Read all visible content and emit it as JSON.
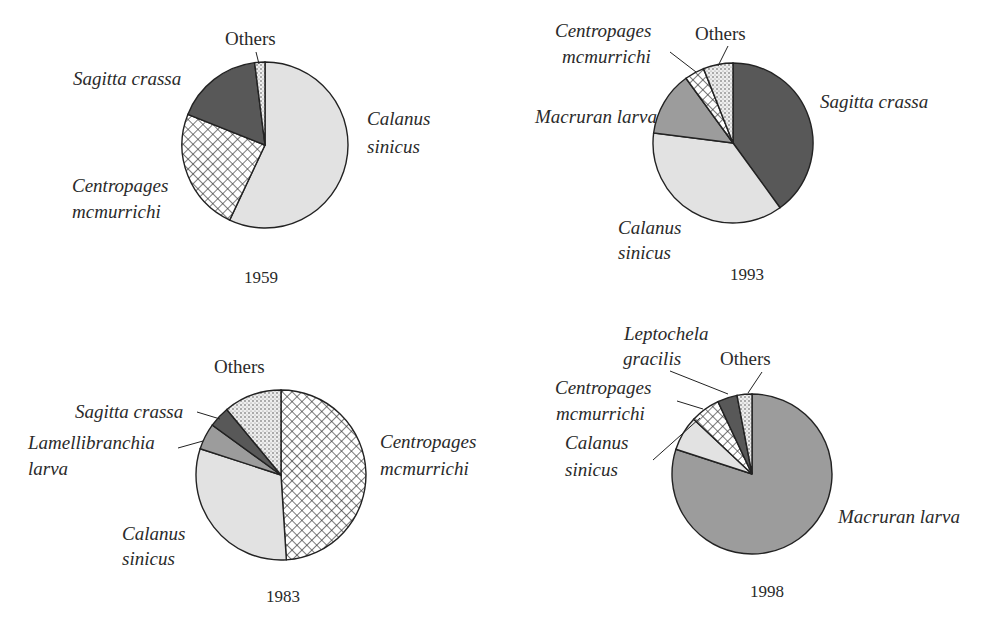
{
  "chart_data": [
    {
      "type": "pie",
      "title": "1959",
      "start_angle_deg": 0,
      "direction": "clockwise",
      "slices": [
        {
          "label": "Calanus sinicus",
          "value": 57,
          "fill": "light-gray"
        },
        {
          "label": "Centropages mcmurrichi",
          "value": 24,
          "fill": "crosshatch"
        },
        {
          "label": "Sagitta crassa",
          "value": 17,
          "fill": "dark-gray"
        },
        {
          "label": "Others",
          "value": 2,
          "fill": "dotted"
        }
      ]
    },
    {
      "type": "pie",
      "title": "1993",
      "start_angle_deg": 0,
      "direction": "clockwise",
      "slices": [
        {
          "label": "Sagitta crassa",
          "value": 40,
          "fill": "dark-gray"
        },
        {
          "label": "Calanus sinicus",
          "value": 37,
          "fill": "light-gray"
        },
        {
          "label": "Macruran larva",
          "value": 13,
          "fill": "medium-gray"
        },
        {
          "label": "Centropages mcmurrichi",
          "value": 4,
          "fill": "crosshatch"
        },
        {
          "label": "Others",
          "value": 6,
          "fill": "dotted"
        }
      ]
    },
    {
      "type": "pie",
      "title": "1983",
      "start_angle_deg": 0,
      "direction": "clockwise",
      "slices": [
        {
          "label": "Centropages mcmurrichi",
          "value": 49,
          "fill": "crosshatch"
        },
        {
          "label": "Calanus sinicus",
          "value": 31,
          "fill": "light-gray"
        },
        {
          "label": "Lamellibranchia larva",
          "value": 5,
          "fill": "medium-gray"
        },
        {
          "label": "Sagitta crassa",
          "value": 4,
          "fill": "dark-gray"
        },
        {
          "label": "Others",
          "value": 11,
          "fill": "dotted"
        }
      ]
    },
    {
      "type": "pie",
      "title": "1998",
      "start_angle_deg": 0,
      "direction": "clockwise",
      "slices": [
        {
          "label": "Macruran larva",
          "value": 80,
          "fill": "medium-gray"
        },
        {
          "label": "Calanus sinicus",
          "value": 7,
          "fill": "light-gray"
        },
        {
          "label": "Centropages mcmurrichi",
          "value": 6,
          "fill": "crosshatch"
        },
        {
          "label": "Leptochela gracilis",
          "value": 4,
          "fill": "dark-gray"
        },
        {
          "label": "Others",
          "value": 3,
          "fill": "dotted"
        }
      ]
    }
  ],
  "colors": {
    "light-gray": "#e2e2e2",
    "medium-gray": "#9c9c9c",
    "dark-gray": "#585858",
    "outline": "#222222"
  },
  "panels": {
    "p1959": {
      "year": "1959",
      "labels": {
        "others": "Others",
        "sagitta": "Sagitta crassa",
        "calanus_1": "Calanus",
        "calanus_2": "sinicus",
        "centropages_1": "Centropages",
        "centropages_2": "mcmurrichi"
      }
    },
    "p1993": {
      "year": "1993",
      "labels": {
        "centropages_1": "Centropages",
        "centropages_2": "mcmurrichi",
        "others": "Others",
        "macruran": "Macruran larva",
        "sagitta": "Sagitta crassa",
        "calanus_1": "Calanus",
        "calanus_2": "sinicus"
      }
    },
    "p1983": {
      "year": "1983",
      "labels": {
        "others": "Others",
        "sagitta": "Sagitta crassa",
        "lamelli_1": "Lamellibranchia",
        "lamelli_2": "larva",
        "calanus_1": "Calanus",
        "calanus_2": "sinicus",
        "centropages_1": "Centropages",
        "centropages_2": "mcmurrichi"
      }
    },
    "p1998": {
      "year": "1998",
      "labels": {
        "leptochela_1": "Leptochela",
        "leptochela_2": "gracilis",
        "others": "Others",
        "centropages_1": "Centropages",
        "centropages_2": "mcmurrichi",
        "calanus_1": "Calanus",
        "calanus_2": "sinicus",
        "macruran": "Macruran larva"
      }
    }
  }
}
